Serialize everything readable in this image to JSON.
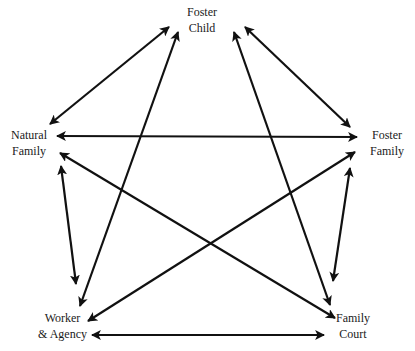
{
  "nodes": {
    "foster_child": {
      "line1": "Foster",
      "line2": "Child"
    },
    "natural_family": {
      "line1": "Natural",
      "line2": "Family"
    },
    "foster_family": {
      "line1": "Foster",
      "line2": "Family"
    },
    "worker_agency": {
      "line1": "Worker",
      "line2": "& Agency"
    },
    "family_court": {
      "line1": "Family",
      "line2": "Court"
    }
  },
  "edges": [
    {
      "from": "Foster Child",
      "to": "Natural Family",
      "bidirectional": true
    },
    {
      "from": "Foster Child",
      "to": "Worker & Agency",
      "bidirectional": true
    },
    {
      "from": "Foster Child",
      "to": "Foster Family",
      "bidirectional": true
    },
    {
      "from": "Foster Child",
      "to": "Family Court",
      "bidirectional": true
    },
    {
      "from": "Natural Family",
      "to": "Foster Family",
      "bidirectional": true
    },
    {
      "from": "Natural Family",
      "to": "Family Court",
      "bidirectional": true
    },
    {
      "from": "Natural Family",
      "to": "Worker & Agency",
      "bidirectional": true
    },
    {
      "from": "Foster Family",
      "to": "Worker & Agency",
      "bidirectional": true
    },
    {
      "from": "Foster Family",
      "to": "Family Court",
      "bidirectional": true
    },
    {
      "from": "Worker & Agency",
      "to": "Family Court",
      "bidirectional": true
    }
  ],
  "colors": {
    "line": "#111111",
    "background": "#ffffff"
  }
}
